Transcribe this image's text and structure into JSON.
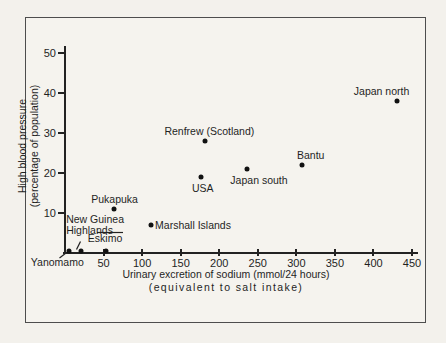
{
  "chart_data": {
    "type": "scatter",
    "title": "",
    "xlabel": "Urinary excretion of sodium (mmol/24 hours)",
    "xlabel_line2": "(equivalent to salt intake)",
    "ylabel_line1": "High blood pressure",
    "ylabel_line2": "(percentage of population)",
    "xlim": [
      0,
      460
    ],
    "ylim": [
      0,
      52
    ],
    "x_ticks": [
      50,
      100,
      150,
      200,
      250,
      300,
      350,
      400,
      450
    ],
    "y_ticks": [
      10,
      20,
      30,
      40,
      50
    ],
    "grid": false,
    "legend": false,
    "point_color": "#111111",
    "points": [
      {
        "label": "Yanomamo",
        "x": 5,
        "y": 0.5,
        "label_pos": "free",
        "dx": -38,
        "dy": 6
      },
      {
        "label": "New Guinea\nHighlands",
        "x": 21,
        "y": 0.5,
        "label_pos": "free",
        "dx": -15,
        "dy": -37
      },
      {
        "label": "Eskimo",
        "x": 53,
        "y": 0.5,
        "label_pos": "free",
        "dx": -18,
        "dy": -18
      },
      {
        "label": "Pukapuka",
        "x": 63,
        "y": 11,
        "label_pos": "above",
        "dx": 1
      },
      {
        "label": "Marshall Islands",
        "x": 111,
        "y": 7,
        "label_pos": "right",
        "dx": 0
      },
      {
        "label": "USA",
        "x": 176,
        "y": 19,
        "label_pos": "below",
        "dx": 2
      },
      {
        "label": "Renfrew (Scotland)",
        "x": 182,
        "y": 28,
        "label_pos": "above",
        "dx": 4
      },
      {
        "label": "Japan south",
        "x": 236,
        "y": 21,
        "label_pos": "below",
        "dx": 12
      },
      {
        "label": "Bantu",
        "x": 307,
        "y": 22,
        "label_pos": "above",
        "dx": 9
      },
      {
        "label": "Japan north",
        "x": 430,
        "y": 38,
        "label_pos": "above",
        "dx": -15
      }
    ]
  },
  "colors": {
    "background": "#f3f1ec",
    "ink": "#1f1f1f",
    "frame_border": "#4d4d4d"
  }
}
